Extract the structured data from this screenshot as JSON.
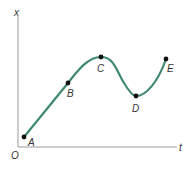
{
  "diagram": {
    "type": "position-time graph",
    "axes": {
      "y_label": "x",
      "x_label": "t",
      "origin_label": "O",
      "axis_color": "#9a9a9a"
    },
    "curve": {
      "color": "#3f8a6e",
      "description": "x increases linearly from A to B, peaks at C, dips to a minimum at D, rises again to E"
    },
    "points": [
      {
        "label": "A",
        "x": 24,
        "y": 137
      },
      {
        "label": "B",
        "x": 68,
        "y": 83
      },
      {
        "label": "C",
        "x": 101,
        "y": 57
      },
      {
        "label": "D",
        "x": 136,
        "y": 96
      },
      {
        "label": "E",
        "x": 166,
        "y": 59
      }
    ]
  }
}
